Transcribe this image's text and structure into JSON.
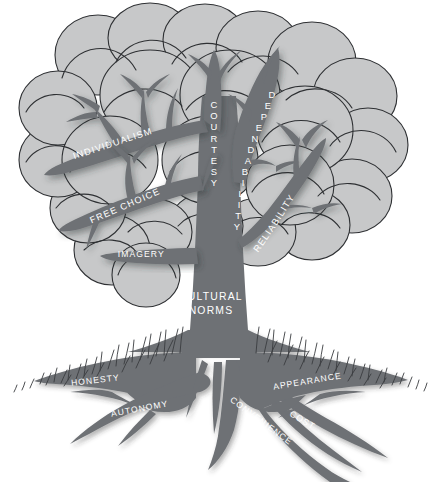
{
  "diagram": {
    "type": "tree-metaphor-diagram",
    "trunk": {
      "label_line1": "CULTURAL",
      "label_line2": "NORMS"
    },
    "branches": [
      {
        "id": "individualism",
        "label": "INDIVIDUALISM",
        "orientation": "diagonal-up-right",
        "side": "left"
      },
      {
        "id": "free-choice",
        "label": "FREE CHOICE",
        "orientation": "diagonal-up-right",
        "side": "left"
      },
      {
        "id": "imagery",
        "label": "IMAGERY",
        "orientation": "horizontal",
        "side": "left"
      },
      {
        "id": "courtesy",
        "label": "COURTESY",
        "orientation": "vertical-down",
        "side": "center"
      },
      {
        "id": "dependability",
        "label": "DEPENDABILITY",
        "orientation": "vertical-down-curved",
        "side": "right"
      },
      {
        "id": "reliability",
        "label": "RELIABILITY",
        "orientation": "diagonal-up-right-curved",
        "side": "right"
      }
    ],
    "roots": [
      {
        "id": "honesty",
        "label": "HONESTY",
        "side": "left"
      },
      {
        "id": "autonomy",
        "label": "AUTONOMY",
        "side": "left"
      },
      {
        "id": "convenience",
        "label": "CONVENIENCE",
        "side": "right"
      },
      {
        "id": "cost",
        "label": "COST",
        "side": "right"
      },
      {
        "id": "appearance",
        "label": "APPEARANCE",
        "side": "right"
      }
    ],
    "ground": {
      "label": "grass-line"
    },
    "colors": {
      "canopy_fill": "#c7c8c9",
      "wood_fill": "#6e7175",
      "outline": "#2e3033",
      "label_text": "#ffffff",
      "background": "#ffffff"
    }
  }
}
